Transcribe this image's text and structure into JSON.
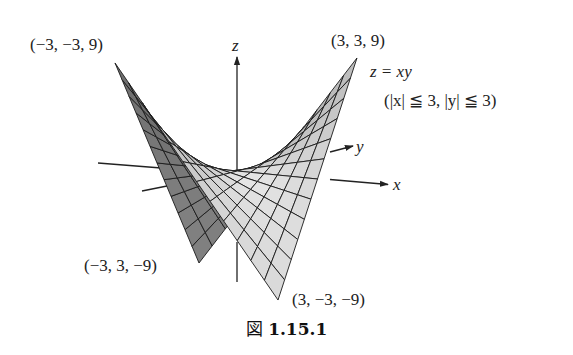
{
  "figure": {
    "equation": "z = xy",
    "domain": "(|x| ≦ 3, |y| ≦ 3)",
    "caption_prefix": "図",
    "caption_number": "1.15.1"
  },
  "axes": {
    "x_label": "x",
    "y_label": "y",
    "z_label": "z"
  },
  "corner_labels": {
    "top_left": "(−3, −3, 9)",
    "top_right": "(3, 3, 9)",
    "bottom_left": "(−3, 3, −9)",
    "bottom_right": "(3, −3, −9)"
  },
  "surface": {
    "function": "z = x*y",
    "x_range": [
      -3,
      3
    ],
    "y_range": [
      -3,
      3
    ],
    "grid_divisions": 12,
    "projection": {
      "origin": [
        237.25,
        171
      ],
      "ex": [
        26.75,
        2.67
      ],
      "ey": [
        13.58,
        -3.5
      ],
      "ez": [
        -0.14,
        -12.28
      ]
    },
    "colors": {
      "grid_line": "#1a1a1a",
      "dark_face": "#6e6e6e",
      "light_face": "#e2e2e2",
      "axis": "#222222"
    }
  }
}
